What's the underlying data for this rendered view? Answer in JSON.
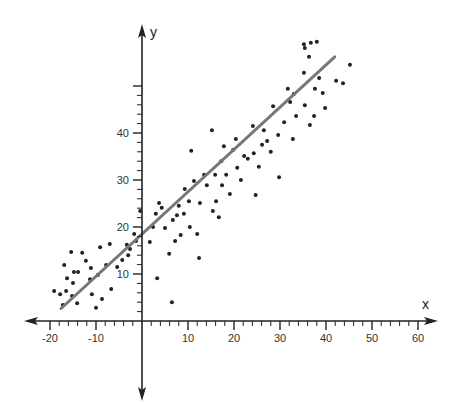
{
  "chart_data": {
    "type": "scatter",
    "title": "",
    "xlabel": "x",
    "ylabel": "y",
    "xlim": [
      -24,
      64
    ],
    "ylim": [
      -9,
      63
    ],
    "x_ticks": [
      -20,
      -10,
      10,
      20,
      30,
      40,
      50,
      60
    ],
    "y_ticks": [
      10,
      20,
      30,
      40
    ],
    "grid": false,
    "legend": null,
    "series": [
      {
        "name": "data",
        "type": "scatter",
        "color": "#222222",
        "points": [
          [
            -15.4,
            14.7
          ],
          [
            -13.0,
            14.5
          ],
          [
            -12.2,
            12.8
          ],
          [
            -16.9,
            11.9
          ],
          [
            -14.8,
            10.4
          ],
          [
            -13.9,
            10.4
          ],
          [
            -11.1,
            11.3
          ],
          [
            -16.3,
            9.1
          ],
          [
            -15.0,
            8.1
          ],
          [
            -11.3,
            8.9
          ],
          [
            -19.1,
            6.4
          ],
          [
            -17.8,
            5.7
          ],
          [
            -16.5,
            6.4
          ],
          [
            -10.9,
            5.7
          ],
          [
            -15.2,
            5.3
          ],
          [
            -17.2,
            3.4
          ],
          [
            -14.1,
            3.8
          ],
          [
            -10.0,
            2.8
          ],
          [
            -8.7,
            4.7
          ],
          [
            -6.7,
            6.8
          ],
          [
            -9.6,
            9.8
          ],
          [
            -7.8,
            11.9
          ],
          [
            -5.4,
            11.5
          ],
          [
            -4.3,
            13.0
          ],
          [
            -3.3,
            16.2
          ],
          [
            -7.0,
            16.4
          ],
          [
            -9.1,
            15.7
          ],
          [
            -2.6,
            15.3
          ],
          [
            -1.3,
            17.0
          ],
          [
            -0.4,
            23.4
          ],
          [
            -3.0,
            14.0
          ],
          [
            -1.7,
            18.5
          ],
          [
            1.7,
            16.8
          ],
          [
            2.4,
            20.0
          ],
          [
            3.0,
            22.8
          ],
          [
            3.7,
            25.1
          ],
          [
            3.3,
            9.1
          ],
          [
            4.3,
            24.1
          ],
          [
            5.0,
            19.8
          ],
          [
            5.9,
            14.3
          ],
          [
            6.5,
            4.0
          ],
          [
            6.7,
            21.5
          ],
          [
            7.6,
            22.5
          ],
          [
            7.2,
            17.0
          ],
          [
            8.0,
            24.5
          ],
          [
            8.4,
            18.3
          ],
          [
            9.1,
            22.8
          ],
          [
            9.3,
            28.1
          ],
          [
            10.2,
            25.5
          ],
          [
            10.7,
            36.2
          ],
          [
            10.4,
            20.0
          ],
          [
            11.3,
            29.8
          ],
          [
            12.0,
            18.5
          ],
          [
            12.4,
            13.4
          ],
          [
            12.6,
            25.1
          ],
          [
            13.5,
            31.1
          ],
          [
            14.1,
            28.9
          ],
          [
            15.2,
            40.6
          ],
          [
            15.4,
            23.4
          ],
          [
            15.9,
            31.1
          ],
          [
            16.1,
            25.5
          ],
          [
            16.7,
            22.1
          ],
          [
            17.2,
            34.0
          ],
          [
            17.4,
            28.9
          ],
          [
            17.8,
            37.2
          ],
          [
            18.3,
            31.1
          ],
          [
            19.1,
            27.0
          ],
          [
            19.8,
            36.4
          ],
          [
            20.4,
            38.7
          ],
          [
            20.7,
            32.6
          ],
          [
            21.5,
            30.0
          ],
          [
            22.2,
            35.1
          ],
          [
            23.0,
            34.5
          ],
          [
            24.1,
            41.5
          ],
          [
            24.3,
            35.7
          ],
          [
            24.7,
            26.8
          ],
          [
            25.4,
            32.8
          ],
          [
            26.1,
            37.5
          ],
          [
            26.5,
            40.6
          ],
          [
            27.2,
            38.3
          ],
          [
            28.0,
            36.0
          ],
          [
            28.5,
            45.7
          ],
          [
            29.6,
            39.6
          ],
          [
            29.8,
            30.6
          ],
          [
            30.9,
            42.3
          ],
          [
            31.7,
            49.4
          ],
          [
            32.2,
            46.6
          ],
          [
            32.8,
            38.7
          ],
          [
            33.0,
            48.3
          ],
          [
            33.5,
            43.6
          ],
          [
            35.4,
            45.9
          ],
          [
            35.2,
            52.8
          ],
          [
            36.5,
            41.7
          ],
          [
            37.4,
            43.6
          ],
          [
            35.2,
            58.9
          ],
          [
            35.4,
            58.1
          ],
          [
            36.7,
            59.2
          ],
          [
            38.0,
            59.4
          ],
          [
            36.3,
            56.2
          ],
          [
            38.5,
            51.7
          ],
          [
            37.6,
            49.4
          ],
          [
            39.8,
            45.3
          ],
          [
            39.3,
            48.5
          ],
          [
            42.2,
            51.1
          ],
          [
            43.7,
            50.6
          ],
          [
            45.2,
            54.5
          ]
        ]
      },
      {
        "name": "regression line",
        "type": "line",
        "color": "#777777",
        "slope": 0.9,
        "intercept": 18.5,
        "x_range": [
          -17.6,
          41.9
        ]
      }
    ]
  }
}
